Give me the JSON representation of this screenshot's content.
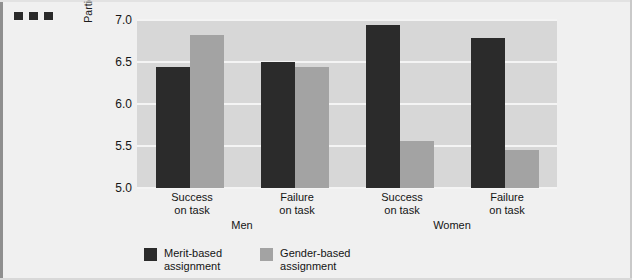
{
  "figure": {
    "background_color": "#f0f0f0",
    "plot_background_color": "#d7d7d7",
    "corner_marks": [
      "mark-1",
      "mark-2",
      "mark-3"
    ]
  },
  "chart_data": {
    "type": "bar",
    "title": "",
    "xlabel": "",
    "ylabel": "Participants' self-ratings of leadership ability",
    "ylim": [
      5.0,
      7.0
    ],
    "yticks": [
      "5.0",
      "5.5",
      "6.0",
      "6.5",
      "7.0"
    ],
    "ytick_values": [
      5.0,
      5.5,
      6.0,
      6.5,
      7.0
    ],
    "grid": true,
    "legend_position": "bottom-left",
    "groups": [
      {
        "name": "Men",
        "categories": [
          "Success\non task",
          "Failure\non task"
        ]
      },
      {
        "name": "Women",
        "categories": [
          "Success\non task",
          "Failure\non task"
        ]
      }
    ],
    "categories": [
      "Men / Success on task",
      "Men / Failure on task",
      "Women / Success on task",
      "Women / Failure on task"
    ],
    "series": [
      {
        "name": "Merit-based assignment",
        "color": "#2b2b2b",
        "values": [
          6.44,
          6.5,
          6.94,
          6.79
        ]
      },
      {
        "name": "Gender-based assignment",
        "color": "#a3a3a3",
        "values": [
          6.82,
          6.44,
          5.56,
          5.45
        ]
      }
    ]
  },
  "axis": {
    "ticks": [
      {
        "label": "7.0",
        "value": 7.0
      },
      {
        "label": "6.5",
        "value": 6.5
      },
      {
        "label": "6.0",
        "value": 6.0
      },
      {
        "label": "5.5",
        "value": 5.5
      },
      {
        "label": "5.0",
        "value": 5.0
      }
    ]
  },
  "xaxis": {
    "categories": [
      {
        "line1": "Success",
        "line2": "on task"
      },
      {
        "line1": "Failure",
        "line2": "on task"
      },
      {
        "line1": "Success",
        "line2": "on task"
      },
      {
        "line1": "Failure",
        "line2": "on task"
      }
    ],
    "groups": [
      {
        "label": "Men"
      },
      {
        "label": "Women"
      }
    ]
  },
  "legend": {
    "items": [
      {
        "line1": "Merit-based",
        "line2": "assignment",
        "color": "#2b2b2b"
      },
      {
        "line1": "Gender-based",
        "line2": "assignment",
        "color": "#a3a3a3"
      }
    ]
  }
}
